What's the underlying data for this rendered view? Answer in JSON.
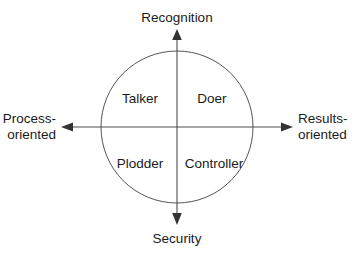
{
  "diagram": {
    "type": "quadrant-model",
    "colors": {
      "text": "#1a1a1a",
      "circle_stroke": "#555555",
      "axis_stroke": "#4d4d4d",
      "arrow_fill": "#333333",
      "background": "#ffffff"
    },
    "geometry": {
      "center_x": 177,
      "center_y": 127,
      "circle_radius": 76
    },
    "axes": {
      "vertical": {
        "top_label": "Recognition",
        "bottom_label": "Security"
      },
      "horizontal": {
        "left_label_line1": "Process-",
        "left_label_line2": "oriented",
        "right_label_line1": "Results-",
        "right_label_line2": "oriented"
      }
    },
    "quadrants": [
      {
        "id": "top-left",
        "label": "Talker",
        "vertical_pole": "Recognition",
        "horizontal_pole": "Process-oriented"
      },
      {
        "id": "top-right",
        "label": "Doer",
        "vertical_pole": "Recognition",
        "horizontal_pole": "Results-oriented"
      },
      {
        "id": "bottom-left",
        "label": "Plodder",
        "vertical_pole": "Security",
        "horizontal_pole": "Process-oriented"
      },
      {
        "id": "bottom-right",
        "label": "Controller",
        "vertical_pole": "Security",
        "horizontal_pole": "Results-oriented"
      }
    ]
  }
}
